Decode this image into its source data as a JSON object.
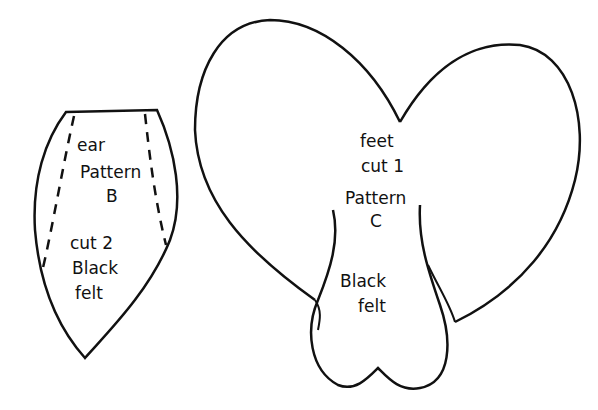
{
  "ear_pattern": {
    "line1": "ear",
    "line2": "Pattern",
    "line3": "B",
    "line4": "cut 2",
    "line5": "Black",
    "line6": "felt"
  },
  "feet_pattern": {
    "line1": "feet",
    "line2": "cut 1",
    "line3": "Pattern",
    "line4": "C",
    "line5": "Black",
    "line6": "felt"
  }
}
